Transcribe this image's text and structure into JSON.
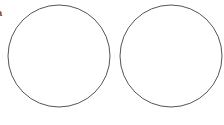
{
  "figure": {
    "panel_label": "a",
    "stroke_color": "#555555",
    "background_color": "#ffffff",
    "circles": [
      {
        "name": "left-circle",
        "cx": 59,
        "cy": 56,
        "r": 51
      },
      {
        "name": "right-circle",
        "cx": 171,
        "cy": 56,
        "r": 51
      }
    ]
  }
}
